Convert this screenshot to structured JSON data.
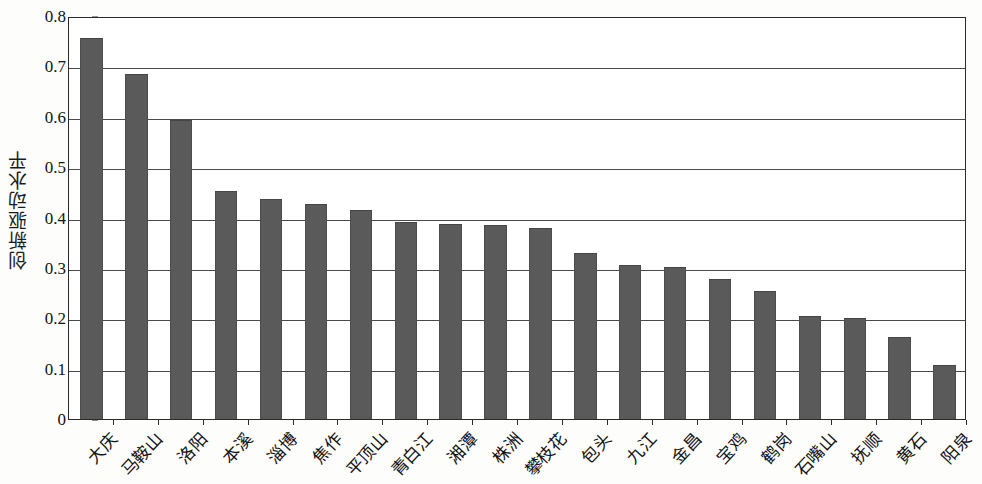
{
  "chart_data": {
    "type": "bar",
    "title": "",
    "subtitle": "",
    "xlabel": "",
    "ylabel": "创新驱动水平",
    "ylim": [
      0,
      0.8
    ],
    "ytick_labels": [
      "0",
      "0.1",
      "0.2",
      "0.3",
      "0.4",
      "0.5",
      "0.6",
      "0.7",
      "0.8"
    ],
    "ytick_values": [
      0,
      0.1,
      0.2,
      0.3,
      0.4,
      0.5,
      0.6,
      0.7,
      0.8
    ],
    "grid": true,
    "legend": false,
    "legend_position": "none",
    "bar_color": "#5a5a5a",
    "axis_color": "#2a2a2a",
    "categories": [
      "大庆",
      "马鞍山",
      "洛阳",
      "本溪",
      "淄博",
      "焦作",
      "平顶山",
      "青白江",
      "湘潭",
      "株洲",
      "攀枝花",
      "包头",
      "九江",
      "金昌",
      "宝鸡",
      "鹤岗",
      "石嘴山",
      "抚顺",
      "黄石",
      "阳泉"
    ],
    "values": [
      0.757,
      0.684,
      0.593,
      0.452,
      0.436,
      0.427,
      0.414,
      0.391,
      0.387,
      0.386,
      0.379,
      0.33,
      0.306,
      0.301,
      0.277,
      0.254,
      0.205,
      0.201,
      0.163,
      0.108
    ]
  }
}
